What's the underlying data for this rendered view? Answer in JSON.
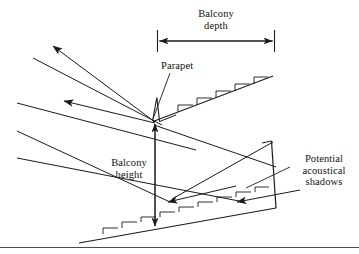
{
  "figure": {
    "background_color": "#ffffff",
    "line_color": "#1a1a1a",
    "labels": {
      "balcony_depth": "Balcony\ndepth",
      "parapet": "Parapet",
      "balcony_height": "Balcony\nheight",
      "potential_acoustical_shadows": "Potential\nacoustical\nshadows"
    },
    "dimension_lines": [
      {
        "name": "balcony-depth",
        "orientation": "horizontal",
        "label": "Balcony depth",
        "from": [
          157,
          41
        ],
        "to": [
          274,
          41
        ],
        "arrowheads": "both",
        "end_ticks": true
      },
      {
        "name": "balcony-height",
        "orientation": "vertical",
        "label": "Balcony height",
        "from": [
          155,
          122
        ],
        "to": [
          155,
          229
        ],
        "arrowheads": "both",
        "end_ticks": false
      }
    ],
    "geometry": {
      "balcony_front_point": [
        153,
        121
      ],
      "parapet_top": [
        157,
        98
      ],
      "upper_slope_end": [
        273,
        76
      ],
      "rear_wall_top": [
        272,
        141
      ],
      "rear_wall_bottom": [
        276,
        208
      ],
      "lower_floor_start": [
        79,
        243
      ],
      "lower_floor_end": [
        276,
        208
      ],
      "upper_seat_count": 5,
      "lower_seat_count": 8
    },
    "sound_rays": [
      {
        "name": "reflected-ray-upper",
        "from": [
          153,
          121
        ],
        "to": [
          50,
          44
        ],
        "arrow": "end"
      },
      {
        "name": "reflected-ray-middle",
        "from": [
          153,
          122
        ],
        "to": [
          61,
          100
        ],
        "arrow": "end"
      },
      {
        "name": "direct-ray-to-balcony-front",
        "from": [
          33,
          58
        ],
        "to": [
          160,
          124
        ],
        "arrow": "none"
      },
      {
        "name": "direct-ray-grazing-parapet",
        "from": [
          17,
          103
        ],
        "to": [
          190,
          148
        ],
        "arrow": "none"
      },
      {
        "name": "under-balcony-ray-upper",
        "from": [
          153,
          124
        ],
        "to": [
          276,
          166
        ],
        "arrow": "none"
      },
      {
        "name": "shadow-ray-left",
        "from": [
          17,
          131
        ],
        "to": [
          168,
          201
        ],
        "arrow": "end"
      },
      {
        "name": "shadow-ray-right",
        "from": [
          17,
          158
        ],
        "to": [
          237,
          201
        ],
        "arrow": "end"
      },
      {
        "name": "under-balcony-ray-lower",
        "from": [
          274,
          141
        ],
        "to": [
          168,
          201
        ],
        "arrow": "none"
      }
    ],
    "leaders": [
      {
        "name": "parapet-leader",
        "from": [
          168,
          72
        ],
        "to": [
          152,
          118
        ]
      },
      {
        "name": "shadows-leader",
        "from": [
          289,
          168
        ],
        "to": [
          244,
          189
        ]
      }
    ],
    "bottom_rule": {
      "y": 247,
      "from_x": 0,
      "to_x": 359
    }
  }
}
